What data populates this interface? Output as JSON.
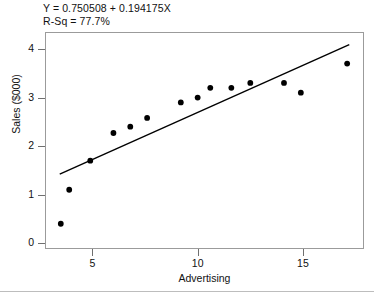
{
  "chart_data": {
    "type": "scatter",
    "title": "",
    "xlabel": "Advertising",
    "ylabel": "Sales ($000)",
    "xlim": [
      2.75,
      17.9
    ],
    "ylim": [
      -0.12,
      4.35
    ],
    "xticks": [
      5,
      10,
      15
    ],
    "yticks": [
      0,
      1,
      2,
      3,
      4
    ],
    "xtick_labels": [
      "5",
      "10",
      "15"
    ],
    "ytick_labels": [
      "0",
      "1",
      "2",
      "3",
      "4"
    ],
    "grid": false,
    "legend": false,
    "marker_color": "#000000",
    "line_color": "#000000",
    "frame_color": "#9b9b9b",
    "points": [
      {
        "x": 3.5,
        "y": 0.4
      },
      {
        "x": 3.9,
        "y": 1.1
      },
      {
        "x": 4.9,
        "y": 1.7
      },
      {
        "x": 6.0,
        "y": 2.27
      },
      {
        "x": 6.8,
        "y": 2.4
      },
      {
        "x": 7.6,
        "y": 2.58
      },
      {
        "x": 9.2,
        "y": 2.9
      },
      {
        "x": 10.0,
        "y": 3.0
      },
      {
        "x": 10.6,
        "y": 3.2
      },
      {
        "x": 11.6,
        "y": 3.2
      },
      {
        "x": 12.5,
        "y": 3.3
      },
      {
        "x": 14.1,
        "y": 3.3
      },
      {
        "x": 14.9,
        "y": 3.1
      },
      {
        "x": 17.1,
        "y": 3.7
      }
    ],
    "fit_line": {
      "intercept": 0.750508,
      "slope": 0.194175,
      "x_start": 3.45,
      "x_end": 17.2
    },
    "annotations": {
      "equation": "Y = 0.750508 + 0.194175X",
      "r_squared": "R-Sq = 77.7%"
    }
  }
}
